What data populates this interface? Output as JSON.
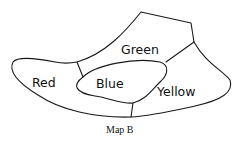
{
  "diagram": {
    "type": "map-regions",
    "regions": [
      {
        "id": "red",
        "label": "Red"
      },
      {
        "id": "green",
        "label": "Green"
      },
      {
        "id": "blue",
        "label": "Blue"
      },
      {
        "id": "yellow",
        "label": "Yellow"
      }
    ],
    "caption": "Map B"
  }
}
